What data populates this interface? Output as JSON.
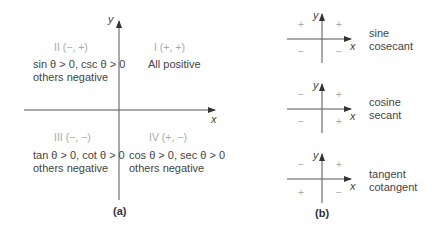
{
  "panel_a": {
    "caption": "(a)",
    "axis_x": "x",
    "axis_y": "y",
    "quadrants": [
      {
        "id": "II",
        "label": "II (−, +)",
        "line1": "sin θ > 0, csc θ > 0",
        "line2": "others negative"
      },
      {
        "id": "I",
        "label": "I (+, +)",
        "line1": "All positive",
        "line2": ""
      },
      {
        "id": "III",
        "label": "III (−, −)",
        "line1": "tan θ > 0, cot θ > 0",
        "line2": "others negative"
      },
      {
        "id": "IV",
        "label": "IV (+, −)",
        "line1": "cos θ > 0, sec θ > 0",
        "line2": "others negative"
      }
    ]
  },
  "panel_b": {
    "caption": "(b)",
    "axis_x": "x",
    "axis_y": "y",
    "diagrams": [
      {
        "line1": "sine",
        "line2": "cosecant",
        "signs": {
          "q2": "+",
          "q1": "+",
          "q3": "−",
          "q4": "−"
        }
      },
      {
        "line1": "cosine",
        "line2": "secant",
        "signs": {
          "q2": "−",
          "q1": "+",
          "q3": "−",
          "q4": "+"
        }
      },
      {
        "line1": "tangent",
        "line2": "cotangent",
        "signs": {
          "q2": "−",
          "q1": "+",
          "q3": "+",
          "q4": "−"
        }
      }
    ]
  }
}
